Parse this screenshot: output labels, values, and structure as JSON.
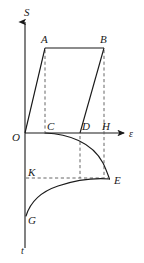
{
  "figure": {
    "axes": {
      "vertical_up_label": "S",
      "vertical_down_label": "t",
      "horizontal_right_label": "ε",
      "origin_label": "O"
    },
    "colors": {
      "stroke": "#1a1a1a",
      "dashed": "#555555",
      "background": "#ffffff"
    },
    "point_labels": [
      {
        "name": "point-label-S",
        "text": "S",
        "x": 24,
        "y": 16
      },
      {
        "name": "point-label-A",
        "text": "A",
        "x": 44,
        "y": 43
      },
      {
        "name": "point-label-B",
        "text": "B",
        "x": 100,
        "y": 43
      },
      {
        "name": "point-label-O",
        "text": "O",
        "x": 12,
        "y": 141
      },
      {
        "name": "point-label-C",
        "text": "C",
        "x": 44,
        "y": 130
      },
      {
        "name": "point-label-D",
        "text": "D",
        "x": 81,
        "y": 130
      },
      {
        "name": "point-label-H",
        "text": "H",
        "x": 102,
        "y": 130
      },
      {
        "name": "point-label-epsilon",
        "text": "ε",
        "x": 130,
        "y": 138
      },
      {
        "name": "point-label-K",
        "text": "K",
        "x": 24,
        "y": 180
      },
      {
        "name": "point-label-E",
        "text": "E",
        "x": 115,
        "y": 186
      },
      {
        "name": "point-label-G",
        "text": "G",
        "x": 26,
        "y": 224
      },
      {
        "name": "point-label-t",
        "text": "t",
        "x": 22,
        "y": 253
      }
    ],
    "geometry": {
      "origin": {
        "x": 25,
        "y": 133
      },
      "x_axis_end": {
        "x": 126,
        "y": 133
      },
      "y_axis_top": {
        "x": 25,
        "y": 18
      },
      "y_axis_bottom": {
        "x": 25,
        "y": 248
      },
      "point_A": {
        "x": 45,
        "y": 48
      },
      "point_B": {
        "x": 104,
        "y": 48
      },
      "point_C": {
        "x": 45,
        "y": 133
      },
      "point_D": {
        "x": 80,
        "y": 133
      },
      "point_H": {
        "x": 104,
        "y": 133
      },
      "point_K": {
        "x": 25,
        "y": 178
      },
      "point_E": {
        "x": 110,
        "y": 179
      },
      "point_G": {
        "x": 26,
        "y": 216
      }
    },
    "curves": [
      {
        "name": "loading-line-OA",
        "description": "straight line from origin O up to A"
      },
      {
        "name": "plateau-line-AB",
        "description": "horizontal top line from A to B"
      },
      {
        "name": "unloading-line-BD",
        "description": "straight line from B down to D"
      },
      {
        "name": "relaxation-curve-CE",
        "description": "curve from C descending to E"
      },
      {
        "name": "recovery-curve-GE",
        "description": "curve from G rising to E"
      }
    ],
    "dashed_lines": [
      {
        "name": "dashed-AC",
        "description": "vertical dashed from A down to C"
      },
      {
        "name": "dashed-BH",
        "description": "vertical dashed from B down through H to E level"
      },
      {
        "name": "dashed-DK",
        "description": "vertical dashed from D down to K level"
      },
      {
        "name": "dashed-KE",
        "description": "horizontal dashed from K across to E"
      }
    ]
  }
}
